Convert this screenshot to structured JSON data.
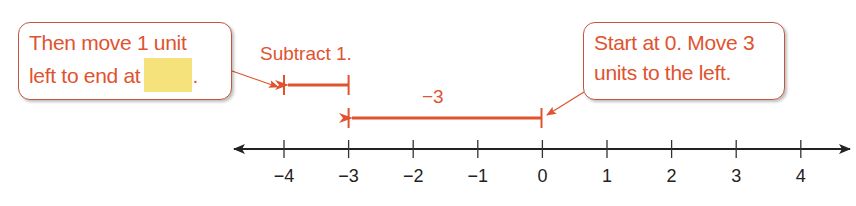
{
  "callouts": {
    "left": {
      "line1": "Then move 1 unit",
      "line2": "left to end at",
      "blank_color": "#f6e27a",
      "trailing": "."
    },
    "right": {
      "line1": "Start at 0. Move 3",
      "line2": "units to the left."
    }
  },
  "annotations": {
    "subtract": "Subtract 1.",
    "move": "−3"
  },
  "number_line": {
    "ticks": [
      "−4",
      "−3",
      "−2",
      "−1",
      "0",
      "1",
      "2",
      "3",
      "4"
    ],
    "min": -4,
    "max": 4,
    "arrows_both_ends": true
  },
  "jumps": [
    {
      "from": 0,
      "to": -3,
      "label": "−3"
    },
    {
      "from": -3,
      "to": -4,
      "label": "Subtract 1."
    }
  ],
  "colors": {
    "accent": "#e0532f",
    "callout_border": "#c0583f",
    "axis": "#222222",
    "blank": "#f6e27a"
  }
}
